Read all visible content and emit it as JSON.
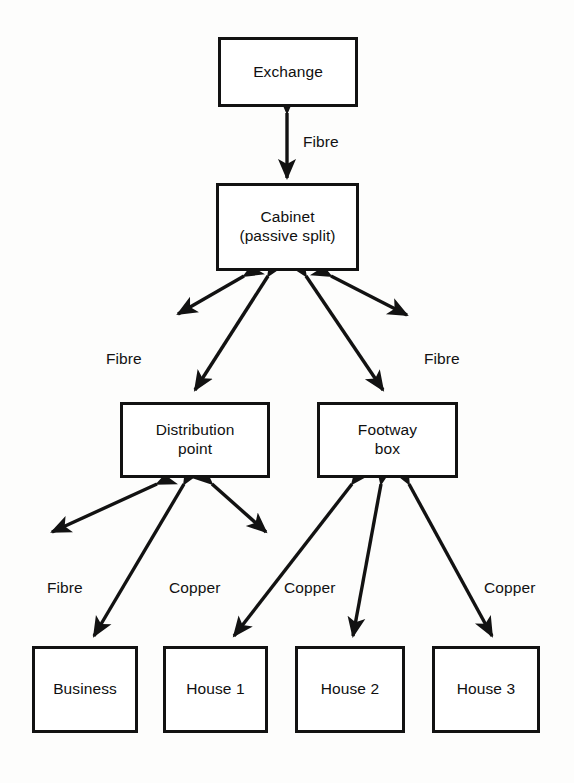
{
  "diagram": {
    "type": "network-topology",
    "stroke_color": "#121212",
    "background_color": "#fdfdfc",
    "nodes": [
      {
        "id": "exchange",
        "label_line1": "Exchange",
        "label_line2": "",
        "x": 218,
        "y": 37,
        "w": 140,
        "h": 70
      },
      {
        "id": "cabinet",
        "label_line1": "Cabinet",
        "label_line2": "(passive split)",
        "x": 216,
        "y": 183,
        "w": 143,
        "h": 88
      },
      {
        "id": "distribution-point",
        "label_line1": "Distribution",
        "label_line2": "point",
        "x": 120,
        "y": 402,
        "w": 150,
        "h": 76
      },
      {
        "id": "footway-box",
        "label_line1": "Footway",
        "label_line2": "box",
        "x": 317,
        "y": 402,
        "w": 141,
        "h": 76
      },
      {
        "id": "business",
        "label_line1": "Business",
        "label_line2": "",
        "x": 32,
        "y": 646,
        "w": 106,
        "h": 87
      },
      {
        "id": "house-1",
        "label_line1": "House 1",
        "label_line2": "",
        "x": 163,
        "y": 646,
        "w": 105,
        "h": 87
      },
      {
        "id": "house-2",
        "label_line1": "House 2",
        "label_line2": "",
        "x": 295,
        "y": 646,
        "w": 110,
        "h": 87
      },
      {
        "id": "house-3",
        "label_line1": "House 3",
        "label_line2": "",
        "x": 432,
        "y": 646,
        "w": 108,
        "h": 87
      }
    ],
    "edge_labels": [
      {
        "id": "fibre-exchange-cabinet",
        "text": "Fibre",
        "x": 303,
        "y": 133
      },
      {
        "id": "fibre-cabinet-left",
        "text": "Fibre",
        "x": 106,
        "y": 350
      },
      {
        "id": "fibre-cabinet-right",
        "text": "Fibre",
        "x": 424,
        "y": 350
      },
      {
        "id": "fibre-dp-business",
        "text": "Fibre",
        "x": 47,
        "y": 579
      },
      {
        "id": "copper-dp-house1",
        "text": "Copper",
        "x": 169,
        "y": 579
      },
      {
        "id": "copper-fb-house1",
        "text": "Copper",
        "x": 284,
        "y": 579
      },
      {
        "id": "copper-fb-house3",
        "text": "Copper",
        "x": 484,
        "y": 579
      }
    ],
    "connections": [
      {
        "id": "exchange-to-cabinet",
        "from": "exchange",
        "to": "cabinet",
        "media": "Fibre",
        "x1": 287,
        "y1": 110,
        "x2": 287,
        "y2": 180
      },
      {
        "id": "cabinet-to-left-outer",
        "from": "cabinet",
        "to": "",
        "media": "Fibre",
        "x1": 243,
        "y1": 273,
        "x2": 176,
        "y2": 313
      },
      {
        "id": "cabinet-to-distribution",
        "from": "cabinet",
        "to": "distribution-point",
        "media": "Fibre",
        "x1": 267,
        "y1": 273,
        "x2": 192,
        "y2": 392
      },
      {
        "id": "cabinet-to-footway",
        "from": "cabinet",
        "to": "footway-box",
        "media": "Fibre",
        "x1": 307,
        "y1": 273,
        "x2": 385,
        "y2": 392
      },
      {
        "id": "cabinet-to-right-outer",
        "from": "cabinet",
        "to": "",
        "media": "Fibre",
        "x1": 333,
        "y1": 273,
        "x2": 409,
        "y2": 314
      },
      {
        "id": "dp-to-left-outer",
        "from": "distribution-point",
        "to": "",
        "media": "Fibre",
        "x1": 155,
        "y1": 482,
        "x2": 48,
        "y2": 532
      },
      {
        "id": "dp-to-business",
        "from": "distribution-point",
        "to": "business",
        "media": "Fibre",
        "x1": 183,
        "y1": 482,
        "x2": 92,
        "y2": 637
      },
      {
        "id": "dp-to-house1",
        "from": "distribution-point",
        "to": "house-1",
        "media": "Copper",
        "x1": 213,
        "y1": 482,
        "x2": 268,
        "y2": 532
      },
      {
        "id": "fb-to-house1",
        "from": "footway-box",
        "to": "house-1",
        "media": "Copper",
        "x1": 353,
        "y1": 482,
        "x2": 232,
        "y2": 637
      },
      {
        "id": "fb-to-house2",
        "from": "footway-box",
        "to": "house-2",
        "media": "Copper",
        "x1": 382,
        "y1": 482,
        "x2": 352,
        "y2": 637
      },
      {
        "id": "fb-to-house3",
        "from": "footway-box",
        "to": "house-3",
        "media": "Copper",
        "x1": 410,
        "y1": 482,
        "x2": 494,
        "y2": 637
      }
    ]
  }
}
